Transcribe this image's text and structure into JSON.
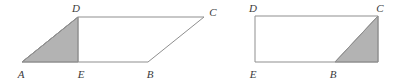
{
  "figure": {
    "background_color": "#ffffff",
    "stroke_color": "#8f8f8f",
    "shade_color": "#b3b3b3",
    "label_color": "#3b3b3b",
    "stroke_width": 1,
    "label_font_style": "italic",
    "label_font_size": 11
  },
  "left_figure": {
    "name": "parallelogram-abcd",
    "shape": "parallelogram",
    "outline_points": "22,62 148,62 204,17 78,17",
    "shaded_region": {
      "name": "triangle-ade",
      "points": "22,62 78,17 78,62",
      "fill": "#b3b3b3"
    },
    "segment_de": {
      "from": "78,17",
      "to": "78,62"
    },
    "labels": [
      {
        "text": "D",
        "x": 76,
        "y": 12,
        "anchor": "middle",
        "name": "label-d"
      },
      {
        "text": "C",
        "x": 213,
        "y": 16,
        "anchor": "middle",
        "name": "label-c"
      },
      {
        "text": "A",
        "x": 21,
        "y": 78,
        "anchor": "middle",
        "name": "label-a"
      },
      {
        "text": "E",
        "x": 81,
        "y": 78,
        "anchor": "middle",
        "name": "label-e"
      },
      {
        "text": "B",
        "x": 150,
        "y": 78,
        "anchor": "middle",
        "name": "label-b"
      }
    ]
  },
  "right_figure": {
    "name": "rectangle-dcbe",
    "shape": "rectangle",
    "outline_points": "255,16 378,16 378,62 255,62",
    "shaded_region": {
      "name": "triangle-bcf",
      "points": "335,62 378,16 378,62",
      "fill": "#b3b3b3"
    },
    "segment_bc": {
      "from": "335,62",
      "to": "378,16"
    },
    "labels": [
      {
        "text": "D",
        "x": 253,
        "y": 12,
        "anchor": "middle",
        "name": "label-d"
      },
      {
        "text": "C",
        "x": 380,
        "y": 12,
        "anchor": "middle",
        "name": "label-c"
      },
      {
        "text": "E",
        "x": 253,
        "y": 78,
        "anchor": "middle",
        "name": "label-e"
      },
      {
        "text": "B",
        "x": 333,
        "y": 78,
        "anchor": "middle",
        "name": "label-b"
      }
    ]
  }
}
